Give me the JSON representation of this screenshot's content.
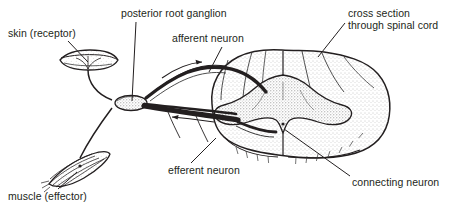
{
  "figure": {
    "background_color": "#ffffff",
    "ink_color": "#231f20",
    "stipple_color": "#7a7a7a",
    "width": 449,
    "height": 209
  },
  "labels": [
    {
      "id": "skin-receptor",
      "text": "skin (receptor)",
      "x": 8,
      "y": 28,
      "align": "left",
      "leader": {
        "x1": 68,
        "y1": 41,
        "x2": 88,
        "y2": 62
      }
    },
    {
      "id": "posterior-root-ganglion",
      "text": "posterior root ganglion",
      "x": 121,
      "y": 8,
      "align": "left",
      "leader": {
        "x1": 136,
        "y1": 22,
        "x2": 132,
        "y2": 101
      }
    },
    {
      "id": "afferent-neuron",
      "text": "afferent neuron",
      "x": 172,
      "y": 33,
      "align": "left",
      "leader": {
        "x1": 222,
        "y1": 47,
        "x2": 209,
        "y2": 72
      }
    },
    {
      "id": "cross-section-spinal-cord",
      "text": "cross section\nthrough spinal cord",
      "x": 348,
      "y": 8,
      "align": "left",
      "leader": {
        "x1": 345,
        "y1": 23,
        "x2": 318,
        "y2": 57
      }
    },
    {
      "id": "efferent-neuron",
      "text": "efferent neuron",
      "x": 168,
      "y": 165,
      "align": "left",
      "leader": {
        "x1": 191,
        "y1": 163,
        "x2": 216,
        "y2": 138
      }
    },
    {
      "id": "muscle-effector",
      "text": "muscle (effector)",
      "x": 8,
      "y": 191,
      "align": "left",
      "leader": {
        "x1": 58,
        "y1": 189,
        "x2": 77,
        "y2": 172
      }
    },
    {
      "id": "connecting-neuron",
      "text": "connecting neuron",
      "x": 352,
      "y": 177,
      "align": "left",
      "leader": {
        "x1": 350,
        "y1": 176,
        "x2": 284,
        "y2": 129
      }
    }
  ],
  "structures": [
    {
      "id": "skin-receptor-organ",
      "name": "skin receptor (tactile corpuscle)"
    },
    {
      "id": "muscle-spindle",
      "name": "striated muscle (effector)"
    },
    {
      "id": "posterior-root-ganglion-body",
      "name": "posterior root ganglion"
    },
    {
      "id": "spinal-cord-cross-section",
      "name": "spinal cord cross section"
    },
    {
      "id": "grey-matter-butterfly",
      "name": "grey matter (butterfly)"
    },
    {
      "id": "afferent-fibre",
      "name": "afferent nerve fibre"
    },
    {
      "id": "efferent-fibre",
      "name": "efferent nerve fibre"
    },
    {
      "id": "direction-arrow-afferent",
      "name": "impulse direction arrow (afferent)"
    },
    {
      "id": "direction-arrow-efferent",
      "name": "impulse direction arrow (efferent)"
    }
  ]
}
